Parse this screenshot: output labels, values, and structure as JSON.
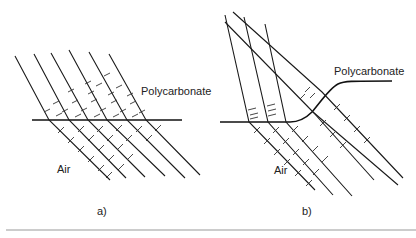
{
  "panels": [
    {
      "id": "a",
      "caption": "a)",
      "medium_top_label": "Polycarbonate",
      "medium_bottom_label": "Air",
      "interface": "flat"
    },
    {
      "id": "b",
      "caption": "b)",
      "medium_top_label": "Polycarbonate",
      "medium_bottom_label": "Air",
      "interface": "stepped-curve"
    }
  ],
  "colors": {
    "line": "#1a1a1a",
    "divider": "#9a9a9a",
    "background": "#ffffff"
  }
}
